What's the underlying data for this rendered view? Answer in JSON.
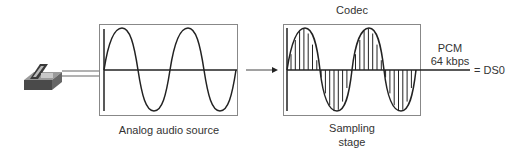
{
  "diagram": {
    "nodes": {
      "phone": {
        "icon": "telephone-icon"
      },
      "analog_box": {
        "label": "Analog audio source"
      },
      "codec_box": {
        "title": "Codec",
        "label_line1": "Sampling",
        "label_line2": "stage"
      },
      "output": {
        "line1": "PCM",
        "line2": "64 kbps",
        "result": "= DS0"
      }
    },
    "colors": {
      "stroke": "#222222",
      "box_border": "#888888",
      "phone_body": "#555555",
      "phone_top": "#9a9a9a"
    }
  }
}
